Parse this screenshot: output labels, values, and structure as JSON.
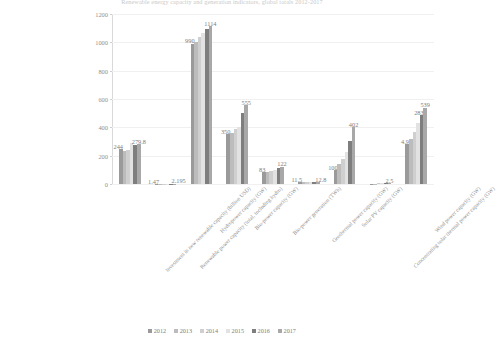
{
  "chart_data": {
    "type": "bar",
    "title": "Renewable energy capacity and generation indicators, global totals 2012-2017",
    "xlabel": "",
    "ylabel": "",
    "ylim": [
      0,
      1200
    ],
    "yticks": [
      0,
      200,
      400,
      600,
      800,
      1000,
      1200
    ],
    "grid": true,
    "legend_position": "bottom",
    "categories": [
      "Investment in new renewable capacity (billion USD)",
      "Renewable power capacity (total, including hydro)",
      "Hydropower capacity (GW)",
      "Bio-power capacity (GW)",
      "Bio-power generation (TWh)",
      "Geothermal power capacity (GW)",
      "Solar PV capacity (GW)",
      "Concentrating solar thermal power capacity (GW)",
      "Wind power capacity (GW)"
    ],
    "series": [
      {
        "name": "2012",
        "color": "#9a9a9a",
        "values": [
          244,
          1.47,
          990,
          350,
          83,
          11.5,
          100,
          2.5,
          283
        ]
      },
      {
        "name": "2013",
        "color": "#bcbcbc",
        "values": [
          232,
          1.56,
          1000,
          360,
          88,
          11.7,
          138,
          3.4,
          318
        ]
      },
      {
        "name": "2014",
        "color": "#cfcfcf",
        "values": [
          242,
          1.7,
          1036,
          390,
          93,
          12.0,
          177,
          4.2,
          370
        ]
      },
      {
        "name": "2015",
        "color": "#e2e2e2",
        "values": [
          286,
          1.85,
          1064,
          404,
          100,
          12.2,
          228,
          4.7,
          433
        ]
      },
      {
        "name": "2016",
        "color": "#7e7e7e",
        "values": [
          275,
          2.01,
          1096,
          500,
          112,
          12.5,
          303,
          4.8,
          487
        ]
      },
      {
        "name": "2017",
        "color": "#a8a8a8",
        "values": [
          279.8,
          2.195,
          1114,
          555,
          122,
          12.8,
          402,
          4.9,
          539
        ]
      }
    ],
    "data_labels": [
      {
        "category_index": 0,
        "series_index": 0,
        "text": "244",
        "align": "left"
      },
      {
        "category_index": 0,
        "series_index": 5,
        "text": "279.8",
        "align": "center"
      },
      {
        "category_index": 1,
        "series_index": 0,
        "text": "1.47",
        "align": "left"
      },
      {
        "category_index": 1,
        "series_index": 5,
        "text": "2.195",
        "align": "right"
      },
      {
        "category_index": 2,
        "series_index": 0,
        "text": "990",
        "align": "left"
      },
      {
        "category_index": 2,
        "series_index": 5,
        "text": "1114",
        "align": "center"
      },
      {
        "category_index": 3,
        "series_index": 0,
        "text": "350",
        "align": "left"
      },
      {
        "category_index": 3,
        "series_index": 5,
        "text": "555",
        "align": "center"
      },
      {
        "category_index": 4,
        "series_index": 0,
        "text": "83",
        "align": "left"
      },
      {
        "category_index": 4,
        "series_index": 5,
        "text": "122",
        "align": "center"
      },
      {
        "category_index": 5,
        "series_index": 0,
        "text": "11.5",
        "align": "left"
      },
      {
        "category_index": 5,
        "series_index": 5,
        "text": "12.8",
        "align": "right"
      },
      {
        "category_index": 6,
        "series_index": 0,
        "text": "100",
        "align": "left"
      },
      {
        "category_index": 6,
        "series_index": 5,
        "text": "402",
        "align": "center"
      },
      {
        "category_index": 7,
        "series_index": 5,
        "text": "2.5",
        "align": "center"
      },
      {
        "category_index": 8,
        "series_index": 0,
        "text": "4.9",
        "align": "left"
      },
      {
        "category_index": 8,
        "series_index": 4,
        "text": "283",
        "align": "left"
      },
      {
        "category_index": 8,
        "series_index": 5,
        "text": "539",
        "align": "center"
      }
    ]
  }
}
